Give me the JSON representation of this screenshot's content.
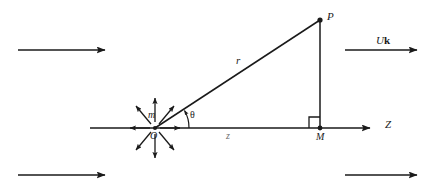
{
  "figure": {
    "kind": "geometry-diagram",
    "background_color": "#ffffff",
    "stroke_color": "#1a1a1a",
    "width": 439,
    "height": 192
  },
  "labels": {
    "point_p": "P",
    "radius": "r",
    "mass": "m",
    "origin": "O",
    "angle": "θ",
    "axial_distance": "z",
    "foot_point": "M",
    "axis": "Z",
    "flow_velocity_italic": "U",
    "flow_velocity_bold": "k"
  },
  "geometry": {
    "origin": {
      "x": 155,
      "y": 128
    },
    "point_p": {
      "x": 320,
      "y": 20
    },
    "point_m": {
      "x": 320,
      "y": 128
    },
    "axis_start": {
      "x": 90,
      "y": 128
    },
    "axis_end": {
      "x": 378,
      "y": 128
    },
    "right_angle_size": 11,
    "angle_arc_radius": 34,
    "source_arrow_length": 26,
    "source_arrow_inner": 6,
    "source_arrow_directions": [
      "up",
      "up-left",
      "up-right",
      "left",
      "right",
      "down",
      "down-left",
      "down-right"
    ]
  },
  "flow_arrows": [
    {
      "name": "flow-arrow-top-left",
      "x1": 18,
      "y1": 50,
      "x2": 113,
      "y2": 50,
      "label": ""
    },
    {
      "name": "flow-arrow-top-right",
      "x1": 345,
      "y1": 50,
      "x2": 425,
      "y2": 50,
      "label": "Uk"
    },
    {
      "name": "flow-arrow-bottom-left",
      "x1": 18,
      "y1": 175,
      "x2": 113,
      "y2": 175,
      "label": ""
    },
    {
      "name": "flow-arrow-bottom-right",
      "x1": 345,
      "y1": 175,
      "x2": 425,
      "y2": 175,
      "label": ""
    }
  ]
}
